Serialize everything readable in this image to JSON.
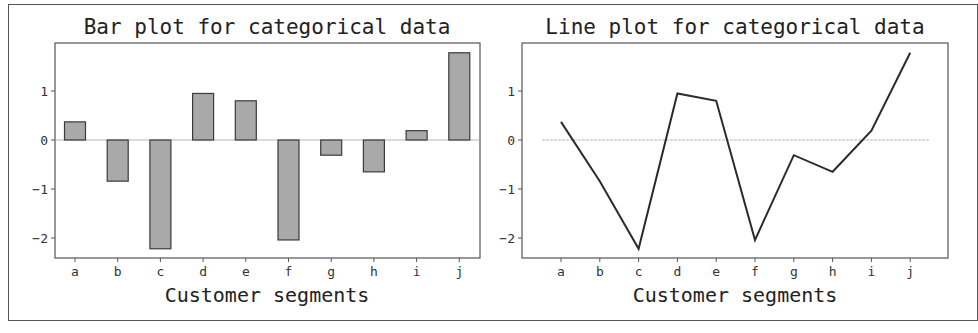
{
  "chart_data": [
    {
      "type": "bar",
      "title": "Bar plot for categorical data",
      "xlabel": "Customer segments",
      "ylabel": "",
      "categories": [
        "a",
        "b",
        "c",
        "d",
        "e",
        "f",
        "g",
        "h",
        "i",
        "j"
      ],
      "values": [
        0.37,
        -0.84,
        -2.22,
        0.95,
        0.8,
        -2.04,
        -0.31,
        -0.65,
        0.19,
        1.78
      ],
      "yticks": [
        1,
        0,
        -1,
        -2
      ],
      "ytick_labels": [
        "1",
        "0",
        "−1",
        "−2"
      ],
      "ylim": [
        -2.45,
        1.92
      ],
      "grid": false,
      "baseline": 0,
      "colors": {
        "fill": "#a9a9a9",
        "edge": "#3a3a3a",
        "baseline": "#cfcfcf"
      }
    },
    {
      "type": "line",
      "title": "Line plot for categorical data",
      "xlabel": "Customer segments",
      "ylabel": "",
      "categories": [
        "a",
        "b",
        "c",
        "d",
        "e",
        "f",
        "g",
        "h",
        "i",
        "j"
      ],
      "values": [
        0.37,
        -0.84,
        -2.22,
        0.95,
        0.8,
        -2.04,
        -0.31,
        -0.65,
        0.19,
        1.78
      ],
      "yticks": [
        1,
        0,
        -1,
        -2
      ],
      "ytick_labels": [
        "1",
        "0",
        "−1",
        "−2"
      ],
      "ylim": [
        -2.45,
        1.92
      ],
      "grid": false,
      "baseline": 0,
      "colors": {
        "line": "#2b2b2b",
        "baseline": "#d0d0d0"
      }
    }
  ]
}
